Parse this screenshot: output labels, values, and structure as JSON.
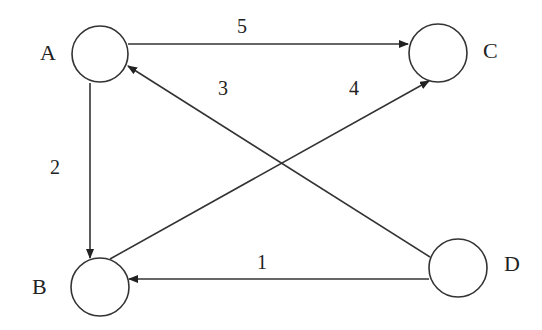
{
  "diagram": {
    "type": "directed-weighted-graph",
    "colors": {
      "stroke": "#333333",
      "text": "#222222",
      "background": "#ffffff"
    },
    "nodes": [
      {
        "id": "A",
        "label": "A",
        "cx": 100,
        "cy": 54,
        "r": 28,
        "label_x": 40,
        "label_y": 60
      },
      {
        "id": "C",
        "label": "C",
        "cx": 438,
        "cy": 53,
        "r": 29,
        "label_x": 483,
        "label_y": 58
      },
      {
        "id": "B",
        "label": "B",
        "cx": 100,
        "cy": 287,
        "r": 29,
        "label_x": 32,
        "label_y": 294
      },
      {
        "id": "D",
        "label": "D",
        "cx": 458,
        "cy": 268,
        "r": 29,
        "label_x": 504,
        "label_y": 271
      }
    ],
    "edges": [
      {
        "from": "A",
        "to": "C",
        "weight": "5",
        "x1": 128,
        "y1": 44,
        "x2": 408,
        "y2": 44,
        "label_x": 237,
        "label_y": 33
      },
      {
        "from": "D",
        "to": "A",
        "weight": "3",
        "x1": 430,
        "y1": 257,
        "x2": 128,
        "y2": 66,
        "label_x": 218,
        "label_y": 95
      },
      {
        "from": "B",
        "to": "C",
        "weight": "4",
        "x1": 110,
        "y1": 259,
        "x2": 429,
        "y2": 81,
        "label_x": 349,
        "label_y": 95
      },
      {
        "from": "A",
        "to": "B",
        "weight": "2",
        "x1": 90,
        "y1": 83,
        "x2": 90,
        "y2": 258,
        "label_x": 50,
        "label_y": 174
      },
      {
        "from": "D",
        "to": "B",
        "weight": "1",
        "x1": 429,
        "y1": 279,
        "x2": 129,
        "y2": 279,
        "label_x": 257,
        "label_y": 269
      }
    ]
  }
}
